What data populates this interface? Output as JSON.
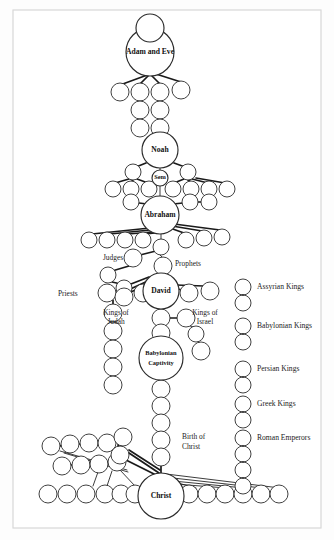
{
  "figure": {
    "background_color": "#fdfdfd",
    "border_color": "#d8d8d8",
    "node_stroke_color": "#2b2b2b",
    "link_color": "#1a1a1a",
    "text_color": "#111111"
  },
  "major_nodes": [
    {
      "id": "adam_eve",
      "label": "Adam and Eve",
      "cx": 150,
      "cy": 52,
      "r": 24,
      "label_dy": 0,
      "style": "major"
    },
    {
      "id": "adam_eve_top",
      "label": "",
      "cx": 150,
      "cy": 28,
      "r": 14,
      "label_dy": 0,
      "style": "major"
    },
    {
      "id": "noah",
      "label": "Noah",
      "cx": 160,
      "cy": 150,
      "r": 18,
      "label_dy": 0,
      "style": "major"
    },
    {
      "id": "sem",
      "label": "Sem",
      "cx": 160,
      "cy": 178,
      "r": 8,
      "label_dy": 0,
      "style": "major-sm"
    },
    {
      "id": "abraham",
      "label": "Abraham",
      "cx": 160,
      "cy": 215,
      "r": 19,
      "label_dy": 0,
      "style": "major"
    },
    {
      "id": "david",
      "label": "David",
      "cx": 161,
      "cy": 291,
      "r": 18,
      "label_dy": 0,
      "style": "major"
    },
    {
      "id": "babylonian_captivity",
      "label": "Babylonian Captivity",
      "cx": 161,
      "cy": 358,
      "r": 22,
      "label_dy": 0,
      "style": "major-sm"
    },
    {
      "id": "christ",
      "label": "Christ",
      "cx": 161,
      "cy": 496,
      "r": 23,
      "label_dy": 0,
      "style": "major"
    }
  ],
  "side_labels": [
    {
      "id": "judges",
      "text": "Judges",
      "x": 113,
      "y": 258,
      "anchor": "middle"
    },
    {
      "id": "prophets",
      "text": "Prophets",
      "x": 175,
      "y": 264,
      "anchor": "start"
    },
    {
      "id": "priests",
      "text": "Priests",
      "x": 58,
      "y": 294,
      "anchor": "start"
    },
    {
      "id": "kings_of_judah_1",
      "text": "Kings of",
      "x": 116,
      "y": 313,
      "anchor": "middle"
    },
    {
      "id": "kings_of_judah_2",
      "text": "Judah",
      "x": 116,
      "y": 322,
      "anchor": "middle"
    },
    {
      "id": "kings_of_israel_1",
      "text": "Kings of",
      "x": 205,
      "y": 313,
      "anchor": "middle"
    },
    {
      "id": "kings_of_israel_2",
      "text": "Israel",
      "x": 205,
      "y": 322,
      "anchor": "middle"
    },
    {
      "id": "birth_of_christ_1",
      "text": "Birth of",
      "x": 182,
      "y": 437,
      "anchor": "start"
    },
    {
      "id": "birth_of_christ_2",
      "text": "Christ",
      "x": 182,
      "y": 447,
      "anchor": "start"
    }
  ],
  "captivity_label_lines": [
    "Babylonian",
    "Captivity"
  ],
  "legend": {
    "column_x": 243,
    "label_x": 257,
    "entries": [
      {
        "id": "assyrian-kings",
        "label": "Assyrian Kings",
        "y": 287
      },
      {
        "id": "babylonian-kings",
        "label": "Babylonian Kings",
        "y": 326
      },
      {
        "id": "persian-kings",
        "label": "Persian Kings",
        "y": 369
      },
      {
        "id": "greek-kings",
        "label": "Greek Kings",
        "y": 404
      },
      {
        "id": "roman-emperors",
        "label": "Roman Emperors",
        "y": 438
      }
    ],
    "circle_radius": 8,
    "circle_pairs": [
      {
        "entry": "assyrian-kings",
        "cys": [
          287,
          303
        ]
      },
      {
        "entry": "babylonian-kings",
        "cys": [
          326,
          342
        ]
      },
      {
        "entry": "persian-kings",
        "cys": [
          369,
          385
        ]
      },
      {
        "entry": "greek-kings",
        "cys": [
          404,
          420
        ]
      },
      {
        "entry": "roman-emperors",
        "cys": [
          438,
          454,
          470,
          486
        ]
      }
    ]
  },
  "minor_nodes": {
    "adam_children": [
      {
        "cx": 120,
        "cy": 92,
        "r": 9
      },
      {
        "cx": 140,
        "cy": 92,
        "r": 9
      },
      {
        "cx": 160,
        "cy": 92,
        "r": 9
      },
      {
        "cx": 181,
        "cy": 90,
        "r": 9
      }
    ],
    "adam_chain_left": [
      {
        "cx": 140,
        "cy": 110,
        "r": 9
      },
      {
        "cx": 140,
        "cy": 128,
        "r": 9
      }
    ],
    "adam_chain_right": [
      {
        "cx": 160,
        "cy": 110,
        "r": 9
      },
      {
        "cx": 160,
        "cy": 128,
        "r": 9
      }
    ],
    "noah_children": [
      {
        "cx": 133,
        "cy": 172,
        "r": 8
      },
      {
        "cx": 188,
        "cy": 172,
        "r": 8
      }
    ],
    "noah_grandchildren": [
      {
        "cx": 113,
        "cy": 189,
        "r": 8
      },
      {
        "cx": 131,
        "cy": 189,
        "r": 8
      },
      {
        "cx": 149,
        "cy": 189,
        "r": 8
      },
      {
        "cx": 173,
        "cy": 189,
        "r": 8
      },
      {
        "cx": 191,
        "cy": 189,
        "r": 8
      },
      {
        "cx": 209,
        "cy": 189,
        "r": 8
      },
      {
        "cx": 227,
        "cy": 189,
        "r": 8
      }
    ],
    "abraham_siblings": [
      {
        "cx": 131,
        "cy": 202,
        "r": 8
      },
      {
        "cx": 190,
        "cy": 202,
        "r": 8
      },
      {
        "cx": 209,
        "cy": 202,
        "r": 8
      }
    ],
    "abraham_children": [
      {
        "cx": 89,
        "cy": 240,
        "r": 8
      },
      {
        "cx": 107,
        "cy": 240,
        "r": 8
      },
      {
        "cx": 125,
        "cy": 240,
        "r": 8
      },
      {
        "cx": 143,
        "cy": 240,
        "r": 8
      },
      {
        "cx": 186,
        "cy": 240,
        "r": 8
      },
      {
        "cx": 204,
        "cy": 238,
        "r": 8
      },
      {
        "cx": 222,
        "cy": 237,
        "r": 8
      },
      {
        "cx": 161,
        "cy": 247,
        "r": 8
      }
    ],
    "judges_chain": [
      {
        "cx": 133,
        "cy": 258,
        "r": 9
      },
      {
        "cx": 108,
        "cy": 275,
        "r": 8
      },
      {
        "cx": 124,
        "cy": 288,
        "r": 8
      }
    ],
    "prophets_node": [
      {
        "cx": 163,
        "cy": 266,
        "r": 9
      }
    ],
    "david_row_left": [
      {
        "cx": 107,
        "cy": 293,
        "r": 9
      },
      {
        "cx": 124,
        "cy": 297,
        "r": 9
      },
      {
        "cx": 143,
        "cy": 293,
        "r": 9
      }
    ],
    "david_row_right": [
      {
        "cx": 189,
        "cy": 293,
        "r": 9
      },
      {
        "cx": 210,
        "cy": 291,
        "r": 9
      }
    ],
    "priests_chain": [
      {
        "cx": 113,
        "cy": 313,
        "r": 9
      },
      {
        "cx": 113,
        "cy": 331,
        "r": 9
      },
      {
        "cx": 113,
        "cy": 349,
        "r": 9
      },
      {
        "cx": 113,
        "cy": 367,
        "r": 9
      },
      {
        "cx": 113,
        "cy": 385,
        "r": 9
      }
    ],
    "kings_judah": [
      {
        "cx": 161,
        "cy": 318,
        "r": 9
      },
      {
        "cx": 161,
        "cy": 333,
        "r": 9
      }
    ],
    "kings_israel": [
      {
        "cx": 186,
        "cy": 318,
        "r": 9
      },
      {
        "cx": 196,
        "cy": 334,
        "r": 8
      },
      {
        "cx": 201,
        "cy": 351,
        "r": 9
      }
    ],
    "captivity_chain": [
      {
        "cx": 161,
        "cy": 389,
        "r": 9
      },
      {
        "cx": 161,
        "cy": 406,
        "r": 9
      },
      {
        "cx": 161,
        "cy": 423,
        "r": 9
      },
      {
        "cx": 161,
        "cy": 440,
        "r": 9
      },
      {
        "cx": 161,
        "cy": 457,
        "r": 9
      }
    ],
    "gentile_row_top": [
      {
        "cx": 51,
        "cy": 446,
        "r": 9
      },
      {
        "cx": 70,
        "cy": 444,
        "r": 9
      },
      {
        "cx": 89,
        "cy": 443,
        "r": 9
      },
      {
        "cx": 107,
        "cy": 443,
        "r": 9
      },
      {
        "cx": 123,
        "cy": 437,
        "r": 9
      }
    ],
    "gentile_row_mid": [
      {
        "cx": 62,
        "cy": 466,
        "r": 9
      },
      {
        "cx": 81,
        "cy": 465,
        "r": 9
      },
      {
        "cx": 99,
        "cy": 464,
        "r": 9
      },
      {
        "cx": 117,
        "cy": 462,
        "r": 9
      },
      {
        "cx": 120,
        "cy": 455,
        "r": 9
      }
    ],
    "gentile_row_bottom_left": [
      {
        "cx": 48,
        "cy": 494,
        "r": 9
      },
      {
        "cx": 67,
        "cy": 494,
        "r": 9
      },
      {
        "cx": 86,
        "cy": 494,
        "r": 9
      },
      {
        "cx": 105,
        "cy": 494,
        "r": 9
      },
      {
        "cx": 121,
        "cy": 494,
        "r": 9
      },
      {
        "cx": 135,
        "cy": 494,
        "r": 9
      }
    ],
    "gentile_row_bottom_right": [
      {
        "cx": 189,
        "cy": 494,
        "r": 9
      },
      {
        "cx": 207,
        "cy": 494,
        "r": 9
      },
      {
        "cx": 225,
        "cy": 494,
        "r": 9
      },
      {
        "cx": 243,
        "cy": 494,
        "r": 9
      },
      {
        "cx": 261,
        "cy": 494,
        "r": 9
      },
      {
        "cx": 279,
        "cy": 494,
        "r": 9
      }
    ]
  },
  "links": [
    {
      "x1": 150,
      "y1": 74,
      "x2": 120,
      "y2": 85,
      "w": "thick"
    },
    {
      "x1": 150,
      "y1": 74,
      "x2": 140,
      "y2": 84,
      "w": "thick"
    },
    {
      "x1": 152,
      "y1": 76,
      "x2": 160,
      "y2": 84,
      "w": "thick"
    },
    {
      "x1": 156,
      "y1": 74,
      "x2": 181,
      "y2": 82,
      "w": "thick"
    },
    {
      "x1": 140,
      "y1": 101,
      "x2": 140,
      "y2": 102,
      "w": "thick"
    },
    {
      "x1": 140,
      "y1": 119,
      "x2": 140,
      "y2": 120,
      "w": "thick"
    },
    {
      "x1": 160,
      "y1": 101,
      "x2": 160,
      "y2": 102,
      "w": "thick"
    },
    {
      "x1": 160,
      "y1": 119,
      "x2": 160,
      "y2": 120,
      "w": "thick"
    },
    {
      "x1": 160,
      "y1": 137,
      "x2": 160,
      "y2": 133,
      "w": "thin"
    },
    {
      "x1": 146,
      "y1": 163,
      "x2": 136,
      "y2": 167,
      "w": "thick"
    },
    {
      "x1": 174,
      "y1": 163,
      "x2": 185,
      "y2": 167,
      "w": "thick"
    },
    {
      "x1": 160,
      "y1": 168,
      "x2": 160,
      "y2": 171,
      "w": "thin"
    },
    {
      "x1": 129,
      "y1": 179,
      "x2": 115,
      "y2": 183,
      "w": "thick"
    },
    {
      "x1": 133,
      "y1": 180,
      "x2": 131,
      "y2": 182,
      "w": "thick"
    },
    {
      "x1": 137,
      "y1": 179,
      "x2": 148,
      "y2": 183,
      "w": "thick"
    },
    {
      "x1": 184,
      "y1": 179,
      "x2": 174,
      "y2": 183,
      "w": "thick"
    },
    {
      "x1": 188,
      "y1": 180,
      "x2": 191,
      "y2": 182,
      "w": "thick"
    },
    {
      "x1": 192,
      "y1": 179,
      "x2": 208,
      "y2": 183,
      "w": "thick"
    },
    {
      "x1": 196,
      "y1": 178,
      "x2": 225,
      "y2": 183,
      "w": "thick"
    },
    {
      "x1": 160,
      "y1": 186,
      "x2": 160,
      "y2": 196,
      "w": "thin"
    },
    {
      "x1": 147,
      "y1": 204,
      "x2": 139,
      "y2": 203,
      "w": "thick"
    },
    {
      "x1": 173,
      "y1": 204,
      "x2": 183,
      "y2": 203,
      "w": "thick"
    },
    {
      "x1": 198,
      "y1": 202,
      "x2": 201,
      "y2": 202,
      "w": "thick"
    },
    {
      "x1": 150,
      "y1": 228,
      "x2": 92,
      "y2": 234,
      "w": "thick"
    },
    {
      "x1": 150,
      "y1": 230,
      "x2": 110,
      "y2": 234,
      "w": "thick"
    },
    {
      "x1": 152,
      "y1": 232,
      "x2": 128,
      "y2": 234,
      "w": "thick"
    },
    {
      "x1": 155,
      "y1": 233,
      "x2": 145,
      "y2": 234,
      "w": "thick"
    },
    {
      "x1": 170,
      "y1": 228,
      "x2": 184,
      "y2": 233,
      "w": "thick"
    },
    {
      "x1": 172,
      "y1": 226,
      "x2": 202,
      "y2": 231,
      "w": "thick"
    },
    {
      "x1": 174,
      "y1": 224,
      "x2": 220,
      "y2": 230,
      "w": "thick"
    },
    {
      "x1": 161,
      "y1": 234,
      "x2": 161,
      "y2": 240,
      "w": "thin"
    },
    {
      "x1": 156,
      "y1": 251,
      "x2": 140,
      "y2": 255,
      "w": "thick"
    },
    {
      "x1": 129,
      "y1": 266,
      "x2": 112,
      "y2": 271,
      "w": "thick"
    },
    {
      "x1": 112,
      "y1": 282,
      "x2": 121,
      "y2": 284,
      "w": "thick"
    },
    {
      "x1": 160,
      "y1": 255,
      "x2": 163,
      "y2": 258,
      "w": "thin"
    },
    {
      "x1": 131,
      "y1": 292,
      "x2": 150,
      "y2": 283,
      "w": "thick"
    },
    {
      "x1": 126,
      "y1": 291,
      "x2": 150,
      "y2": 280,
      "w": "thick"
    },
    {
      "x1": 118,
      "y1": 289,
      "x2": 149,
      "y2": 277,
      "w": "thick"
    },
    {
      "x1": 136,
      "y1": 295,
      "x2": 148,
      "y2": 288,
      "w": "thick"
    },
    {
      "x1": 174,
      "y1": 288,
      "x2": 182,
      "y2": 290,
      "w": "thick"
    },
    {
      "x1": 176,
      "y1": 285,
      "x2": 204,
      "y2": 286,
      "w": "thick"
    },
    {
      "x1": 113,
      "y1": 300,
      "x2": 113,
      "y2": 305,
      "w": "thick"
    },
    {
      "x1": 113,
      "y1": 322,
      "x2": 113,
      "y2": 323,
      "w": "thick"
    },
    {
      "x1": 113,
      "y1": 340,
      "x2": 113,
      "y2": 341,
      "w": "thick"
    },
    {
      "x1": 113,
      "y1": 358,
      "x2": 113,
      "y2": 359,
      "w": "thick"
    },
    {
      "x1": 113,
      "y1": 376,
      "x2": 113,
      "y2": 377,
      "w": "thick"
    },
    {
      "x1": 161,
      "y1": 309,
      "x2": 161,
      "y2": 310,
      "w": "thin"
    },
    {
      "x1": 170,
      "y1": 318,
      "x2": 178,
      "y2": 318,
      "w": "thick"
    },
    {
      "x1": 190,
      "y1": 326,
      "x2": 194,
      "y2": 327,
      "w": "thin"
    },
    {
      "x1": 198,
      "y1": 342,
      "x2": 200,
      "y2": 343,
      "w": "thin"
    },
    {
      "x1": 161,
      "y1": 326,
      "x2": 161,
      "y2": 325,
      "w": "thin"
    },
    {
      "x1": 161,
      "y1": 342,
      "x2": 161,
      "y2": 337,
      "w": "thin"
    },
    {
      "x1": 161,
      "y1": 380,
      "x2": 161,
      "y2": 381,
      "w": "thin"
    },
    {
      "x1": 161,
      "y1": 398,
      "x2": 161,
      "y2": 398,
      "w": "thick"
    },
    {
      "x1": 161,
      "y1": 415,
      "x2": 161,
      "y2": 415,
      "w": "thick"
    },
    {
      "x1": 161,
      "y1": 432,
      "x2": 161,
      "y2": 432,
      "w": "thick"
    },
    {
      "x1": 161,
      "y1": 449,
      "x2": 161,
      "y2": 449,
      "w": "thick"
    },
    {
      "x1": 161,
      "y1": 466,
      "x2": 161,
      "y2": 473,
      "w": "thick"
    },
    {
      "x1": 60,
      "y1": 446,
      "x2": 62,
      "y2": 445,
      "w": "thick"
    },
    {
      "x1": 79,
      "y1": 444,
      "x2": 81,
      "y2": 444,
      "w": "thick"
    },
    {
      "x1": 98,
      "y1": 443,
      "x2": 99,
      "y2": 443,
      "w": "thick"
    },
    {
      "x1": 113,
      "y1": 441,
      "x2": 117,
      "y2": 439,
      "w": "thick"
    },
    {
      "x1": 118,
      "y1": 445,
      "x2": 120,
      "y2": 448,
      "w": "thick"
    },
    {
      "x1": 71,
      "y1": 465,
      "x2": 73,
      "y2": 465,
      "w": "thick"
    },
    {
      "x1": 90,
      "y1": 464,
      "x2": 91,
      "y2": 464,
      "w": "thick"
    },
    {
      "x1": 108,
      "y1": 463,
      "x2": 110,
      "y2": 463,
      "w": "thick"
    },
    {
      "x1": 129,
      "y1": 450,
      "x2": 160,
      "y2": 470,
      "w": "thick"
    },
    {
      "x1": 129,
      "y1": 453,
      "x2": 159,
      "y2": 473,
      "w": "thick"
    },
    {
      "x1": 126,
      "y1": 460,
      "x2": 158,
      "y2": 476,
      "w": "thick"
    },
    {
      "x1": 60,
      "y1": 451,
      "x2": 127,
      "y2": 470,
      "w": "thin"
    },
    {
      "x1": 64,
      "y1": 453,
      "x2": 128,
      "y2": 472,
      "w": "thin"
    },
    {
      "x1": 98,
      "y1": 472,
      "x2": 93,
      "y2": 486,
      "w": "thin"
    },
    {
      "x1": 112,
      "y1": 471,
      "x2": 107,
      "y2": 486,
      "w": "thin"
    },
    {
      "x1": 120,
      "y1": 470,
      "x2": 135,
      "y2": 486,
      "w": "thin"
    },
    {
      "x1": 166,
      "y1": 474,
      "x2": 280,
      "y2": 488,
      "w": "thin"
    },
    {
      "x1": 164,
      "y1": 477,
      "x2": 262,
      "y2": 488,
      "w": "thin"
    },
    {
      "x1": 163,
      "y1": 480,
      "x2": 244,
      "y2": 488,
      "w": "thin"
    },
    {
      "x1": 162,
      "y1": 483,
      "x2": 226,
      "y2": 488,
      "w": "thin"
    },
    {
      "x1": 160,
      "y1": 478,
      "x2": 196,
      "y2": 488,
      "w": "thin"
    }
  ]
}
